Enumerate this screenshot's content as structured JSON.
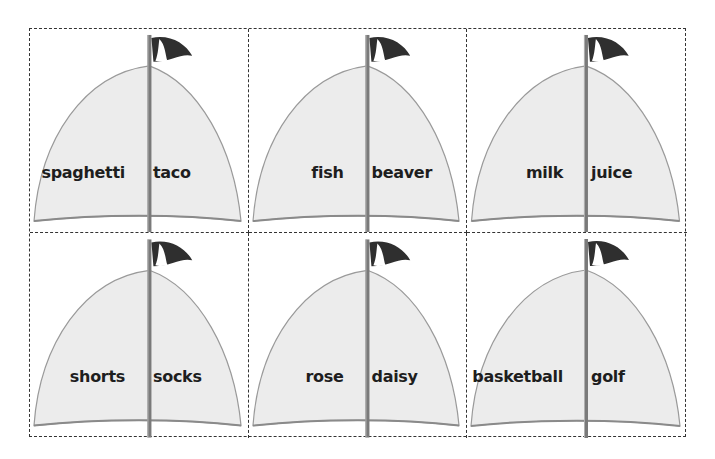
{
  "worksheet": {
    "layout": {
      "columns": 3,
      "rows": 2
    },
    "colors": {
      "sail": "#ececec",
      "sail_edge": "#9a9a9a",
      "mast": "#7a7a7a",
      "flag_dark": "#2f2f2f",
      "flag_light": "#ffffff",
      "cut_line": "#333333",
      "text": "#1e1e1e"
    },
    "cards": [
      {
        "left_word": "spaghetti",
        "right_word": "taco"
      },
      {
        "left_word": "fish",
        "right_word": "beaver"
      },
      {
        "left_word": "milk",
        "right_word": "juice"
      },
      {
        "left_word": "shorts",
        "right_word": "socks"
      },
      {
        "left_word": "rose",
        "right_word": "daisy"
      },
      {
        "left_word": "basketball",
        "right_word": "golf"
      }
    ]
  }
}
